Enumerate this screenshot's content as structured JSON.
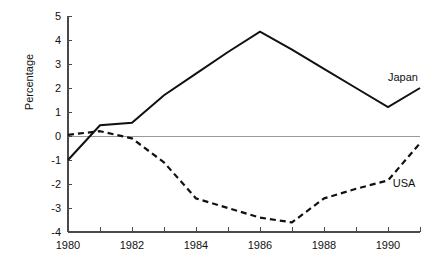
{
  "chart_data": {
    "type": "line",
    "title": "",
    "subtitle": "",
    "xlabel": "",
    "ylabel": "Percentage",
    "x": [
      1980,
      1981,
      1982,
      1983,
      1984,
      1985,
      1986,
      1987,
      1988,
      1989,
      1990,
      1991
    ],
    "xlim": [
      1980,
      1991
    ],
    "ylim": [
      -4,
      5
    ],
    "y_ticks": [
      5,
      4,
      3,
      2,
      1,
      0,
      -1,
      -2,
      -3,
      -4
    ],
    "y_tick_labels": [
      "5",
      "4",
      "3",
      "2",
      "1",
      "0",
      "-1",
      "-2",
      "-3",
      "-4"
    ],
    "x_ticks": [
      1980,
      1981,
      1982,
      1983,
      1984,
      1985,
      1986,
      1987,
      1988,
      1989,
      1990,
      1991
    ],
    "x_tick_labels": [
      "1980",
      "",
      "1982",
      "",
      "1984",
      "",
      "1986",
      "",
      "1988",
      "",
      "1990",
      ""
    ],
    "x_labeled_ticks": [
      {
        "value": 1980,
        "label": "1980"
      },
      {
        "value": 1982,
        "label": "1982"
      },
      {
        "value": 1984,
        "label": "1984"
      },
      {
        "value": 1986,
        "label": "1986"
      },
      {
        "value": 1988,
        "label": "1988"
      },
      {
        "value": 1990,
        "label": "1990"
      }
    ],
    "grid": false,
    "legend_position": "inline-right",
    "zero_line": true,
    "series": [
      {
        "name": "Japan",
        "style": "solid",
        "color": "#111111",
        "label_x": 1990.0,
        "label_y": 2.45,
        "values": [
          -1.0,
          0.45,
          0.55,
          1.7,
          2.6,
          3.5,
          4.35,
          3.6,
          2.8,
          2.0,
          1.2,
          2.0
        ]
      },
      {
        "name": "USA",
        "style": "dashed",
        "color": "#111111",
        "label_x": 1990.15,
        "label_y": -1.95,
        "values": [
          0.05,
          0.2,
          -0.1,
          -1.1,
          -2.6,
          -3.0,
          -3.4,
          -3.6,
          -2.6,
          -2.2,
          -1.85,
          -0.3
        ]
      }
    ]
  }
}
